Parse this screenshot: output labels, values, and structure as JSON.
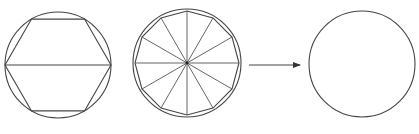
{
  "diagram": {
    "type": "geometric-progression",
    "colors": {
      "background": "#ffffff",
      "stroke": "#444444"
    },
    "figures": [
      {
        "id": "hexagon-in-circle",
        "circle": {
          "cx": 58,
          "cy": 65,
          "r": 53
        },
        "polygon_sides": 6,
        "polygon_orientation": "flat-top",
        "diameter_line": true
      },
      {
        "id": "dodecagon-in-circle",
        "circle": {
          "cx": 187,
          "cy": 63,
          "r": 54
        },
        "polygon_sides": 12,
        "polygon_radius": 52,
        "radial_spokes": 12
      },
      {
        "id": "arrow",
        "from": {
          "x": 249,
          "y": 65
        },
        "to": {
          "x": 300,
          "y": 65
        }
      },
      {
        "id": "circle-limit",
        "circle": {
          "cx": 362,
          "cy": 64,
          "r": 53
        }
      }
    ]
  }
}
